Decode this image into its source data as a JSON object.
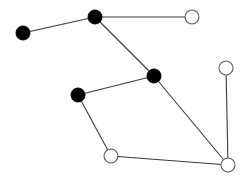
{
  "diagram": {
    "type": "graph",
    "width": 248,
    "height": 182,
    "node_radius": 7,
    "colors": {
      "filled": "#000000",
      "open_fill": "#ffffff",
      "open_stroke": "#5a5a5a",
      "edge": "#3a3a3a"
    },
    "nodes": [
      {
        "id": "A",
        "x": 23,
        "y": 33,
        "style": "filled"
      },
      {
        "id": "B",
        "x": 95,
        "y": 17,
        "style": "filled"
      },
      {
        "id": "C",
        "x": 192,
        "y": 17,
        "style": "open"
      },
      {
        "id": "D",
        "x": 154,
        "y": 76,
        "style": "filled"
      },
      {
        "id": "E",
        "x": 226,
        "y": 68,
        "style": "open"
      },
      {
        "id": "F",
        "x": 78,
        "y": 95,
        "style": "filled"
      },
      {
        "id": "G",
        "x": 111,
        "y": 156,
        "style": "open"
      },
      {
        "id": "H",
        "x": 228,
        "y": 165,
        "style": "open"
      }
    ],
    "edges": [
      {
        "from": "A",
        "to": "B"
      },
      {
        "from": "B",
        "to": "C"
      },
      {
        "from": "B",
        "to": "D"
      },
      {
        "from": "D",
        "to": "F"
      },
      {
        "from": "D",
        "to": "H"
      },
      {
        "from": "F",
        "to": "G"
      },
      {
        "from": "G",
        "to": "H"
      },
      {
        "from": "E",
        "to": "H"
      }
    ]
  }
}
